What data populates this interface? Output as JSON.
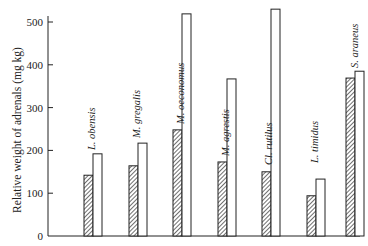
{
  "chart_data": {
    "type": "bar",
    "title": "",
    "xlabel": "",
    "ylabel": "Relative weight of adrenals (mg kg)",
    "ylim": [
      0,
      500
    ],
    "yticks": [
      0,
      100,
      200,
      300,
      400,
      500
    ],
    "grid": false,
    "legend": null,
    "categories": [
      "L. obensis",
      "M. gregalis",
      "M. oeconomus",
      "M. agrestis",
      "Cl. rutilus",
      "L. timidus",
      "S. araneus"
    ],
    "series": [
      {
        "name": "hatched",
        "pattern": "diagonal-hatch",
        "values": [
          142,
          164,
          248,
          173,
          150,
          94,
          369
        ]
      },
      {
        "name": "open",
        "pattern": "open",
        "values": [
          192,
          217,
          519,
          367,
          530,
          133,
          385
        ]
      }
    ]
  }
}
